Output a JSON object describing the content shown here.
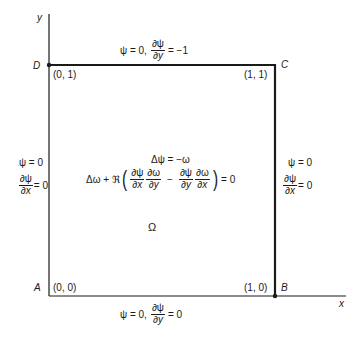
{
  "diagram": {
    "axes": {
      "x_label": "x",
      "y_label": "y"
    },
    "corners": [
      {
        "name": "A",
        "coord": "(0, 0)"
      },
      {
        "name": "B",
        "coord": "(1, 0)"
      },
      {
        "name": "C",
        "coord": "(1, 1)"
      },
      {
        "name": "D",
        "coord": "(0, 1)"
      }
    ],
    "boundary_conditions": {
      "top": {
        "psi": "ψ = 0,",
        "num": "∂ψ",
        "den": "∂y",
        "rhs": "= −1"
      },
      "bottom": {
        "psi": "ψ = 0,",
        "num": "∂ψ",
        "den": "∂y",
        "rhs": "= 0"
      },
      "left": {
        "psi": "ψ = 0",
        "num": "∂ψ",
        "den": "∂x",
        "rhs": "= 0"
      },
      "right": {
        "psi": "ψ = 0",
        "num": "∂ψ",
        "den": "∂x",
        "rhs": "= 0"
      }
    },
    "equations": {
      "line1": "Δψ = −ω",
      "line2": {
        "lead": "Δω + ℜ",
        "t1_num": "∂ψ",
        "t1_den": "∂x",
        "t2_num": "∂ω",
        "t2_den": "∂y",
        "minus": "−",
        "t3_num": "∂ψ",
        "t3_den": "∂y",
        "t4_num": "∂ω",
        "t4_den": "∂x",
        "rhs": "= 0"
      }
    },
    "domain_label": "Ω",
    "line_color": "#1a1a1a"
  }
}
